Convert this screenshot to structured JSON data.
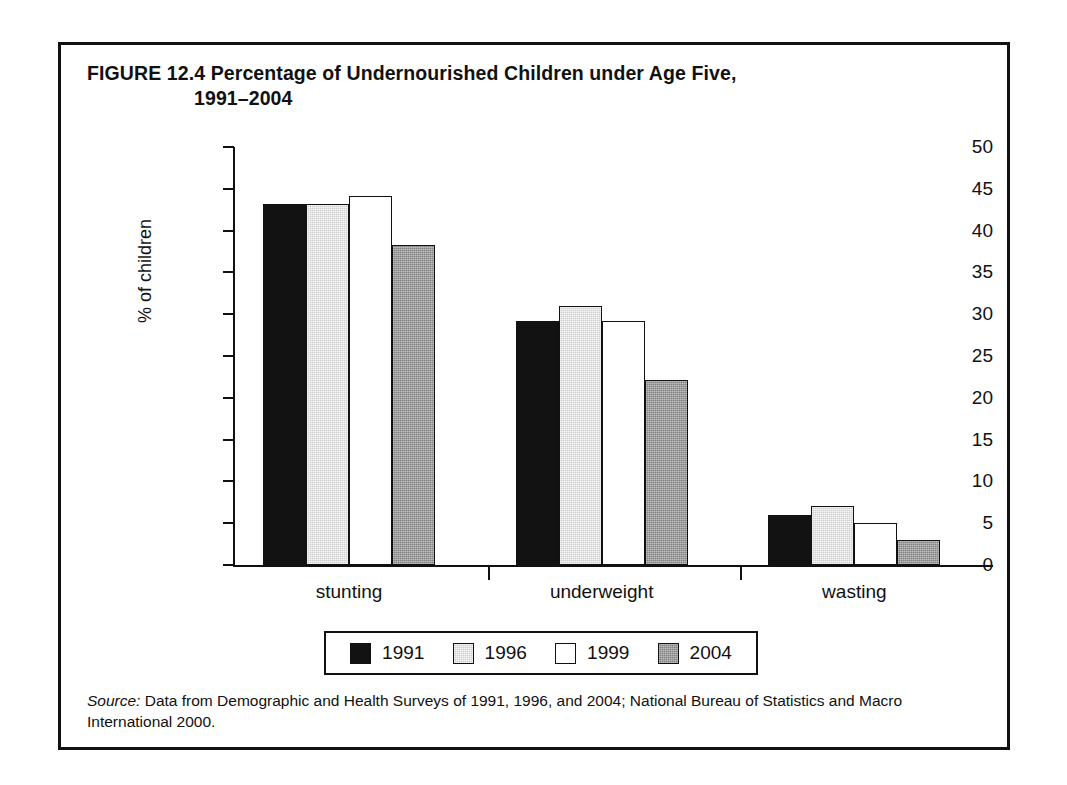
{
  "figure": {
    "number_and_title_line1": "FIGURE 12.4  Percentage of Undernourished Children under Age Five,",
    "number_label": "FIGURE 12.4",
    "title_line1": "Percentage of Undernourished Children under Age Five,",
    "title_line2": "1991–2004",
    "source_prefix": "Source:",
    "source_text": " Data from Demographic and Health Surveys of 1991, 1996, and 2004; National Bureau of Statistics and Macro International 2000."
  },
  "colors": {
    "series_1991": "#121212",
    "series_1996": "#cfcfcf",
    "series_1999": "#ffffff",
    "series_2004": "#828282",
    "axis": "#111111",
    "frame": "#111111",
    "background": "#ffffff"
  },
  "legend": {
    "position": "bottom-center",
    "entries": [
      {
        "label": "1991",
        "swatch": "s1991"
      },
      {
        "label": "1996",
        "swatch": "s1996"
      },
      {
        "label": "1999",
        "swatch": "s1999"
      },
      {
        "label": "2004",
        "swatch": "s2004"
      }
    ]
  },
  "chart_data": {
    "type": "bar",
    "title": "Percentage of Undernourished Children under Age Five, 1991–2004",
    "xlabel": "",
    "ylabel": "% of children",
    "ylim": [
      0,
      50
    ],
    "ytick_step": 5,
    "yticks": [
      0,
      5,
      10,
      15,
      20,
      25,
      30,
      35,
      40,
      45,
      50
    ],
    "ytick_labels": [
      "0",
      "5",
      "10",
      "15",
      "20",
      "25",
      "30",
      "35",
      "40",
      "45",
      "50"
    ],
    "grid": false,
    "legend_position": "bottom-center",
    "categories": [
      "stunting",
      "underweight",
      "wasting"
    ],
    "series": [
      {
        "name": "1991",
        "values": [
          43.2,
          29.2,
          6.0
        ]
      },
      {
        "name": "1996",
        "values": [
          43.2,
          31.0,
          7.0
        ]
      },
      {
        "name": "1999",
        "values": [
          44.2,
          29.2,
          5.0
        ]
      },
      {
        "name": "2004",
        "values": [
          38.3,
          22.1,
          3.0
        ]
      }
    ],
    "source": "Data from Demographic and Health Surveys of 1991, 1996, and 2004; National Bureau of Statistics and Macro International 2000."
  }
}
